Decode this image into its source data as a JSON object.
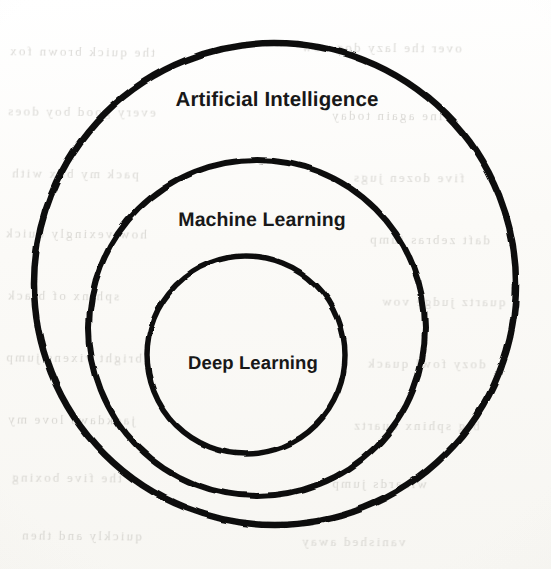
{
  "diagram": {
    "type": "nested-circles",
    "background_color": "#fcfcfa",
    "stroke_color": "#111111",
    "text_color": "#181818",
    "rings": [
      {
        "id": "artificial-intelligence",
        "label": "Artificial Intelligence",
        "level": 1,
        "cx": 275,
        "cy": 284,
        "r": 241,
        "stroke_width": 6.5,
        "label_x": 277,
        "label_y": 100
      },
      {
        "id": "machine-learning",
        "label": "Machine Learning",
        "level": 2,
        "cx": 257,
        "cy": 328,
        "r": 168,
        "stroke_width": 6,
        "label_x": 262,
        "label_y": 220
      },
      {
        "id": "deep-learning",
        "label": "Deep Learning",
        "level": 3,
        "cx": 246,
        "cy": 355,
        "r": 99,
        "stroke_width": 5.5,
        "label_x": 253,
        "label_y": 363
      }
    ]
  },
  "ghost_text": {
    "note": "illegible faint bleed-through text from the reverse side of the scanned page",
    "lines": [
      {
        "x": 8,
        "y": 44,
        "text": "the quick brown fox",
        "rotate": -0.6
      },
      {
        "x": 300,
        "y": 40,
        "text": "over the lazy dog now",
        "rotate": -0.4
      },
      {
        "x": 6,
        "y": 104,
        "text": "every good boy does",
        "rotate": -0.5
      },
      {
        "x": 330,
        "y": 108,
        "text": "fine again today",
        "rotate": -0.3
      },
      {
        "x": 10,
        "y": 166,
        "text": "pack my box with",
        "rotate": -0.5
      },
      {
        "x": 352,
        "y": 170,
        "text": "five dozen jugs",
        "rotate": -0.4
      },
      {
        "x": 4,
        "y": 226,
        "text": "how vexingly quick",
        "rotate": -0.5
      },
      {
        "x": 368,
        "y": 232,
        "text": "daft zebras jump",
        "rotate": -0.4
      },
      {
        "x": 6,
        "y": 288,
        "text": "sphinx of black",
        "rotate": -0.5
      },
      {
        "x": 380,
        "y": 294,
        "text": "quartz judge vow",
        "rotate": -0.3
      },
      {
        "x": 4,
        "y": 350,
        "text": "bright vixens jump",
        "rotate": -0.5
      },
      {
        "x": 366,
        "y": 356,
        "text": "dozy fowl quack",
        "rotate": -0.4
      },
      {
        "x": 6,
        "y": 412,
        "text": "jackdaws love my",
        "rotate": -0.5
      },
      {
        "x": 352,
        "y": 418,
        "text": "big sphinx quartz",
        "rotate": -0.3
      },
      {
        "x": 10,
        "y": 470,
        "text": "the five boxing",
        "rotate": -0.5
      },
      {
        "x": 330,
        "y": 476,
        "text": "wizards jump",
        "rotate": -0.4
      },
      {
        "x": 20,
        "y": 528,
        "text": "quickly and then",
        "rotate": -0.5
      },
      {
        "x": 300,
        "y": 534,
        "text": "vanished away",
        "rotate": -0.3
      }
    ]
  }
}
